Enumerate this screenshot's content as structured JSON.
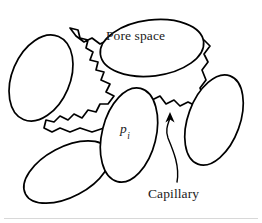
{
  "figure": {
    "type": "diagram",
    "background_color": "#ffffff",
    "stroke_color": "#000000",
    "text_color": "#1a1a1a",
    "width": 262,
    "height": 223
  },
  "labels": {
    "pore_space": "Pore space",
    "capillary": "Capillary",
    "pressure_symbol": "p",
    "pressure_subscript": "i"
  },
  "elements": {
    "grains": [
      {
        "name": "grain-upper-left",
        "cx": 41,
        "cy": 78,
        "rx": 29,
        "ry": 45,
        "rotation": 23
      },
      {
        "name": "grain-lower-left",
        "cx": 67,
        "cy": 172,
        "rx": 47,
        "ry": 25,
        "rotation": -28
      },
      {
        "name": "grain-center",
        "cx": 129,
        "cy": 135,
        "rx": 27,
        "ry": 48,
        "rotation": 14
      },
      {
        "name": "grain-right",
        "cx": 214,
        "cy": 120,
        "rx": 26,
        "ry": 47,
        "rotation": 20
      }
    ],
    "pore_space": {
      "name": "pore-space-region",
      "description": "irregular white region bounded by grains, labelled Pore space"
    },
    "pore_ellipse": {
      "cx": 152,
      "cy": 48,
      "rx": 52,
      "ry": 28,
      "rotation": -7
    },
    "capillary_leader": {
      "name": "capillary-leader-line",
      "from_x": 176,
      "from_y": 183,
      "to_x": 170,
      "to_y": 116,
      "arrow": "up"
    }
  }
}
